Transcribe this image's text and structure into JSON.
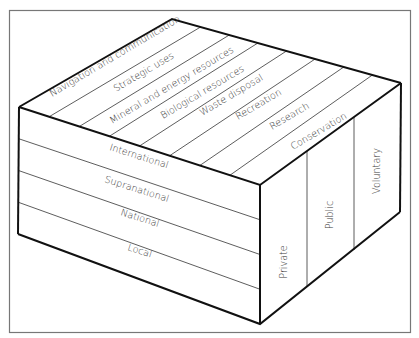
{
  "diagram": {
    "type": "3d-block-matrix",
    "top_face": {
      "label": "Uses",
      "strips": [
        "Navigation and communication",
        "Strategic uses",
        "Mineral and energy resources",
        "Biological resources",
        "Waste disposal",
        "Recreation",
        "Research",
        "Conservation"
      ]
    },
    "front_face": {
      "label": "Levels",
      "bands": [
        "International",
        "Supranational",
        "National",
        "Local"
      ]
    },
    "side_face": {
      "label": "Sectors",
      "columns": [
        "Private",
        "Public",
        "Voluntary"
      ]
    },
    "colors": {
      "line": "#111111",
      "thin_line": "#333333",
      "text": "#3a3a3a",
      "frame": "#777777",
      "background": "#ffffff"
    }
  }
}
